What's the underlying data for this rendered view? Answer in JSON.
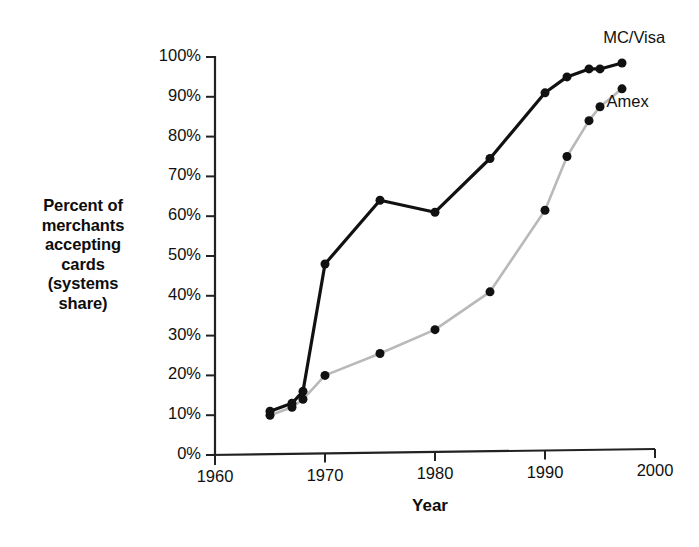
{
  "chart_data": {
    "type": "line",
    "title": "",
    "xlabel": "Year",
    "ylabel": "Percent of merchants accepting cards (systems share)",
    "ylabel_lines": [
      "Percent of",
      "merchants",
      "accepting",
      "cards",
      "(systems",
      "share)"
    ],
    "xlim": [
      1960,
      2000
    ],
    "ylim": [
      0,
      100
    ],
    "grid": false,
    "legend_position": "inline-right-of-series-end",
    "xticks": [
      1960,
      1970,
      1980,
      1990,
      2000
    ],
    "xtick_labels": [
      "1960",
      "1970",
      "1980",
      "1990",
      "2000"
    ],
    "yticks": [
      0,
      10,
      20,
      30,
      40,
      50,
      60,
      70,
      80,
      90,
      100
    ],
    "ytick_labels": [
      "0%",
      "10%",
      "20%",
      "30%",
      "40%",
      "50%",
      "60%",
      "70%",
      "80%",
      "90%",
      "100%"
    ],
    "series": [
      {
        "name": "MC/Visa",
        "color": "#111111",
        "line_width": 3.2,
        "marker": "circle",
        "marker_size": 9,
        "label_x": 1998.2,
        "label_y": 104.5,
        "x": [
          1965,
          1967,
          1968,
          1970,
          1975,
          1980,
          1985,
          1990,
          1992,
          1994,
          1995,
          1997
        ],
        "values": [
          11,
          13,
          16,
          48,
          64,
          61,
          74.5,
          91,
          95,
          97,
          97,
          98.5
        ]
      },
      {
        "name": "Amex",
        "color": "#b9b9b9",
        "line_width": 2.6,
        "marker": "circle",
        "marker_size": 9,
        "label_x": 1997.6,
        "label_y": 88.5,
        "x": [
          1965,
          1967,
          1968,
          1970,
          1975,
          1980,
          1985,
          1990,
          1992,
          1994,
          1995,
          1997
        ],
        "values": [
          10,
          12,
          14,
          20,
          25.5,
          31.5,
          41,
          61.5,
          75,
          84,
          87.5,
          92
        ]
      }
    ],
    "axis_color": "#222222",
    "background": "#ffffff"
  }
}
